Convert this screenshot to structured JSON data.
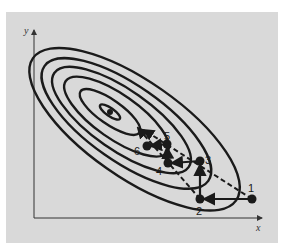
{
  "figure": {
    "type": "contour-optimization-path",
    "axes": {
      "x_label": "x",
      "y_label": "y"
    },
    "contours": {
      "count": 6,
      "center_px": [
        110,
        112
      ],
      "rotation_deg": 35
    },
    "points": [
      {
        "label": "1",
        "px": [
          252,
          199
        ]
      },
      {
        "label": "2",
        "px": [
          200,
          199
        ]
      },
      {
        "label": "3",
        "px": [
          200,
          161
        ]
      },
      {
        "label": "4",
        "px": [
          168,
          163
        ]
      },
      {
        "label": "5",
        "px": [
          167,
          144
        ]
      },
      {
        "label": "6",
        "px": [
          147,
          146
        ]
      }
    ],
    "colors": {
      "background": "#d9d9d9",
      "ink": "#1a1a1a"
    }
  }
}
